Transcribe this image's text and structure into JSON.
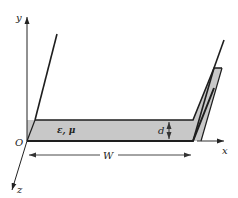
{
  "figure": {
    "type": "parallel-plate waveguide / dielectric slab cross-section",
    "labels": {
      "y_axis": "y",
      "x_axis": "x",
      "z_axis": "z",
      "origin": "O",
      "material": "ε, μ",
      "thickness": "d",
      "width": "W"
    },
    "colors": {
      "line": "#1e1e1e",
      "slab_fill": "#c8c8c8",
      "arrow": "#333333",
      "background": "#ffffff"
    }
  }
}
